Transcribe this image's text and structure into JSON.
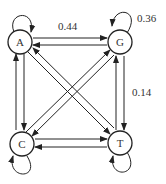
{
  "diagram": {
    "type": "markov-chain-state-transition",
    "nodes": [
      {
        "id": "A",
        "label": "A"
      },
      {
        "id": "G",
        "label": "G"
      },
      {
        "id": "C",
        "label": "C"
      },
      {
        "id": "T",
        "label": "T"
      }
    ],
    "edge_labels": {
      "a_to_g": "0.44",
      "g_self": "0.36",
      "g_to_t": "0.14"
    },
    "colors": {
      "stroke": "#222222",
      "text": "#333333",
      "background": "#ffffff"
    }
  }
}
